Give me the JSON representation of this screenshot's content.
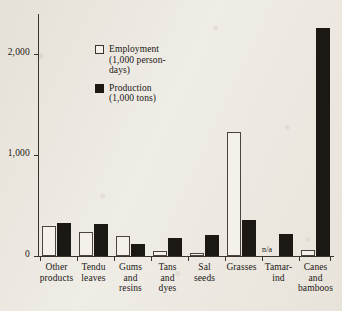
{
  "chart_data": {
    "type": "bar",
    "title": "",
    "subtitle": "",
    "xlabel": "",
    "ylabel": "",
    "ylim": [
      0,
      2400
    ],
    "yticks": [
      0,
      1000,
      2000
    ],
    "ytick_labels": [
      "0",
      "1,000",
      "2,000"
    ],
    "grid": false,
    "legend_position": "inside-upper-left",
    "categories": [
      "Other\nproducts",
      "Tendu\nleaves",
      "Gums\nand\nresins",
      "Tans\nand\ndyes",
      "Sal\nseeds",
      "Grasses",
      "Tamar-\nind",
      "Canes\nand\nbamboos"
    ],
    "series": [
      {
        "name": "Employment",
        "unit": "(1,000 person-\ndays)",
        "color": "#ffffff",
        "values": [
          300,
          240,
          195,
          45,
          30,
          1230,
          null,
          60
        ],
        "value_notes": [
          "",
          "",
          "",
          "",
          "",
          "",
          "n/a",
          ""
        ]
      },
      {
        "name": "Production",
        "unit": "(1,000 tons)",
        "color": "#1c1814",
        "values": [
          330,
          320,
          115,
          175,
          210,
          355,
          215,
          2260
        ],
        "value_notes": [
          "",
          "",
          "",
          "",
          "",
          "",
          "",
          ""
        ]
      }
    ],
    "annotations": [
      {
        "label": "n/a",
        "category": "Tamar-\nind",
        "series": "Employment"
      }
    ]
  },
  "legend": {
    "items": [
      {
        "swatch": "employment",
        "label": "Employment\n(1,000 person-\ndays)"
      },
      {
        "swatch": "production",
        "label": "Production\n(1,000 tons)"
      }
    ]
  },
  "colors": {
    "paper": "#efece6",
    "ink": "#1a1714",
    "bar_fill_dark": "#1c1814",
    "bar_fill_light": "#f4f1ea"
  }
}
